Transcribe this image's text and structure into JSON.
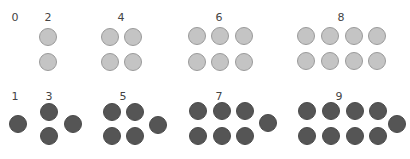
{
  "colors": {
    "even_fill": "#c4c4c4",
    "even_stroke": "#9a9a9a",
    "odd_fill": "#555555",
    "odd_stroke": "#4a4a4a",
    "label": "#444444"
  },
  "even_row": {
    "name": "even-numbers",
    "groups": [
      {
        "label": "0",
        "lx": 15,
        "ly": 21,
        "dots": []
      },
      {
        "label": "2",
        "lx": 48,
        "ly": 21,
        "dots": [
          [
            48,
            37
          ],
          [
            48,
            62
          ]
        ]
      },
      {
        "label": "4",
        "lx": 121,
        "ly": 21,
        "dots": [
          [
            110,
            37
          ],
          [
            133,
            37
          ],
          [
            110,
            62
          ],
          [
            133,
            62
          ]
        ]
      },
      {
        "label": "6",
        "lx": 219,
        "ly": 21,
        "dots": [
          [
            197,
            36
          ],
          [
            220,
            36
          ],
          [
            244,
            36
          ],
          [
            197,
            62
          ],
          [
            220,
            62
          ],
          [
            244,
            62
          ]
        ]
      },
      {
        "label": "8",
        "lx": 341,
        "ly": 21,
        "dots": [
          [
            306,
            36
          ],
          [
            330,
            36
          ],
          [
            354,
            36
          ],
          [
            377,
            36
          ],
          [
            306,
            61
          ],
          [
            330,
            61
          ],
          [
            354,
            61
          ],
          [
            377,
            61
          ]
        ]
      }
    ]
  },
  "odd_row": {
    "name": "odd-numbers",
    "groups": [
      {
        "label": "1",
        "lx": 15,
        "ly": 100,
        "dots": [
          [
            18,
            124
          ]
        ]
      },
      {
        "label": "3",
        "lx": 49,
        "ly": 100,
        "dots": [
          [
            49,
            112
          ],
          [
            49,
            136
          ],
          [
            73,
            124
          ]
        ]
      },
      {
        "label": "5",
        "lx": 123,
        "ly": 100,
        "dots": [
          [
            112,
            112
          ],
          [
            135,
            112
          ],
          [
            112,
            136
          ],
          [
            135,
            136
          ],
          [
            158,
            125
          ]
        ]
      },
      {
        "label": "7",
        "lx": 219,
        "ly": 100,
        "dots": [
          [
            198,
            111
          ],
          [
            222,
            111
          ],
          [
            245,
            111
          ],
          [
            198,
            136
          ],
          [
            222,
            136
          ],
          [
            245,
            136
          ],
          [
            268,
            123
          ]
        ]
      },
      {
        "label": "9",
        "lx": 339,
        "ly": 100,
        "dots": [
          [
            307,
            111
          ],
          [
            331,
            111
          ],
          [
            355,
            111
          ],
          [
            378,
            111
          ],
          [
            307,
            136
          ],
          [
            331,
            136
          ],
          [
            355,
            136
          ],
          [
            378,
            136
          ],
          [
            397,
            124
          ]
        ]
      }
    ]
  },
  "dot_radius": 8.5
}
